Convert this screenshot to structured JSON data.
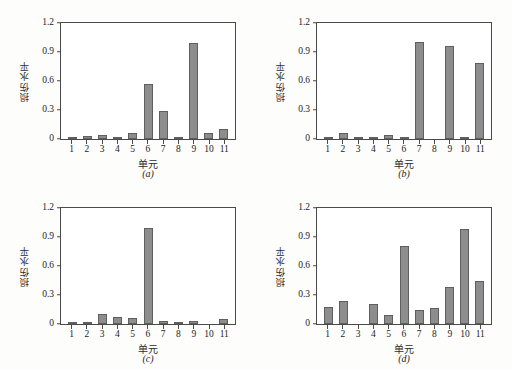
{
  "figure": {
    "axis": {
      "ylabel": "损伤水平",
      "xlabel": "单元",
      "yticks": [
        "0",
        "0.3",
        "0.6",
        "0.9",
        "1.2"
      ],
      "ytick_values": [
        0,
        0.3,
        0.6,
        0.9,
        1.2
      ],
      "ymin": 0,
      "ymax": 1.2,
      "xticks": [
        "1",
        "2",
        "3",
        "4",
        "5",
        "6",
        "7",
        "8",
        "9",
        "10",
        "11"
      ]
    },
    "colors": {
      "bar_fill": "#8d8d8d",
      "bar_edge": "#5f5f5f",
      "axis": "#4a4a4a",
      "text": "#1c1c1c",
      "background": "#fdfdfc"
    },
    "captions": [
      "(a)",
      "(b)",
      "(c)",
      "(d)"
    ]
  },
  "chart_data": [
    {
      "type": "bar",
      "title": "(a)",
      "xlabel": "单元",
      "ylabel": "损伤水平",
      "ylim": [
        0,
        1.2
      ],
      "grid": false,
      "legend": "none",
      "categories": [
        "1",
        "2",
        "3",
        "4",
        "5",
        "6",
        "7",
        "8",
        "9",
        "10",
        "11"
      ],
      "values": [
        0.005,
        0.03,
        0.04,
        0.02,
        0.06,
        0.57,
        0.29,
        0.02,
        0.99,
        0.06,
        0.1
      ]
    },
    {
      "type": "bar",
      "title": "(b)",
      "xlabel": "单元",
      "ylabel": "损伤水平",
      "ylim": [
        0,
        1.2
      ],
      "grid": false,
      "legend": "none",
      "categories": [
        "1",
        "2",
        "3",
        "4",
        "5",
        "6",
        "7",
        "8",
        "9",
        "10",
        "11"
      ],
      "values": [
        0.01,
        0.06,
        0.02,
        0.02,
        0.04,
        0.015,
        1.0,
        0.0,
        0.96,
        0.025,
        0.79
      ]
    },
    {
      "type": "bar",
      "title": "(c)",
      "xlabel": "单元",
      "ylabel": "损伤水平",
      "ylim": [
        0,
        1.2
      ],
      "grid": false,
      "legend": "none",
      "categories": [
        "1",
        "2",
        "3",
        "4",
        "5",
        "6",
        "7",
        "8",
        "9",
        "10",
        "11"
      ],
      "values": [
        0.015,
        0.02,
        0.1,
        0.07,
        0.06,
        0.99,
        0.03,
        0.015,
        0.03,
        0.0,
        0.05
      ]
    },
    {
      "type": "bar",
      "title": "(d)",
      "xlabel": "单元",
      "ylabel": "损伤水平",
      "ylim": [
        0,
        1.2
      ],
      "grid": false,
      "legend": "none",
      "categories": [
        "1",
        "2",
        "3",
        "4",
        "5",
        "6",
        "7",
        "8",
        "9",
        "10",
        "11"
      ],
      "values": [
        0.18,
        0.24,
        0.0,
        0.21,
        0.09,
        0.81,
        0.14,
        0.17,
        0.38,
        0.98,
        0.45
      ]
    }
  ]
}
